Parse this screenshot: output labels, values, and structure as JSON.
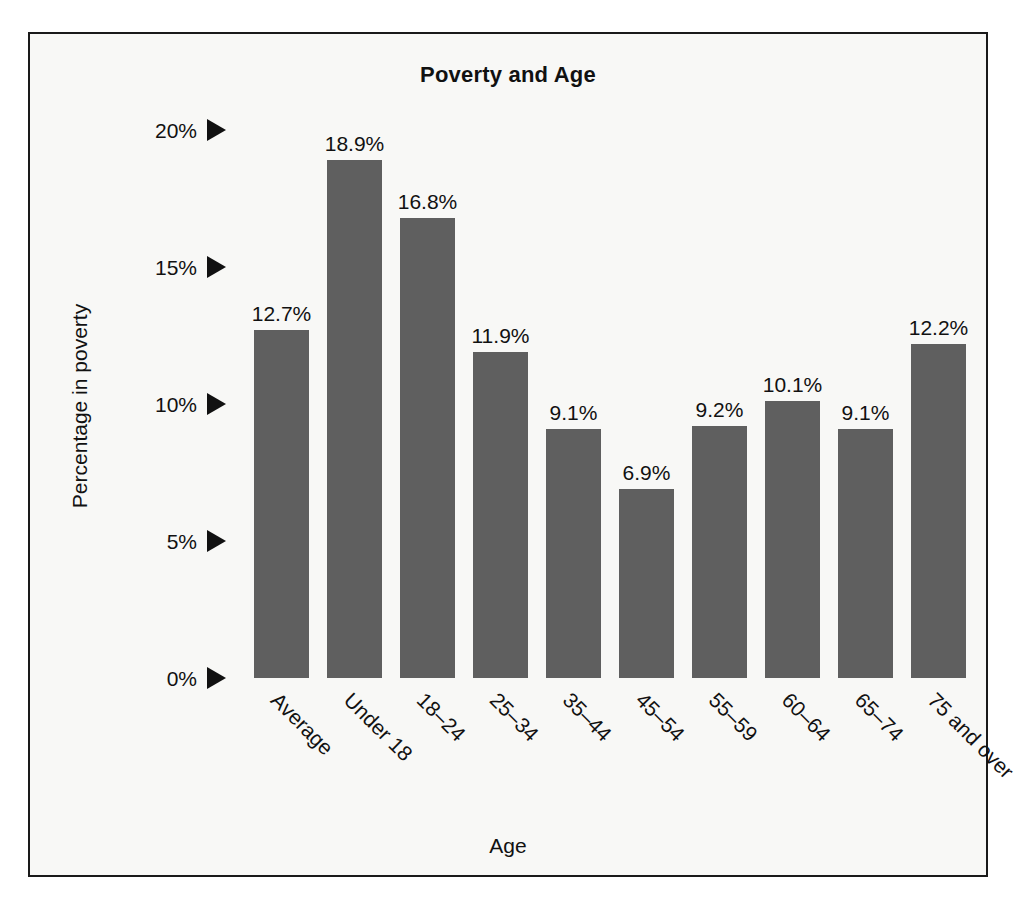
{
  "chart_data": {
    "type": "bar",
    "title": "Poverty and Age",
    "xlabel": "Age",
    "ylabel": "Percentage in poverty",
    "categories": [
      "Average",
      "Under 18",
      "18–24",
      "25–34",
      "35–44",
      "45–54",
      "55–59",
      "60–64",
      "65–74",
      "75 and over"
    ],
    "values": [
      12.7,
      18.9,
      16.8,
      11.9,
      9.1,
      6.9,
      9.2,
      10.1,
      9.1,
      12.2
    ],
    "value_labels": [
      "12.7%",
      "18.9%",
      "16.8%",
      "11.9%",
      "9.1%",
      "6.9%",
      "9.2%",
      "10.1%",
      "9.1%",
      "12.2%"
    ],
    "ylim": [
      0,
      20
    ],
    "ytick_values": [
      0,
      5,
      10,
      15,
      20
    ],
    "ytick_labels": [
      "0%",
      "5%",
      "10%",
      "15%",
      "20%"
    ],
    "ytick_marker": "right-triangle-marker",
    "grid": false,
    "legend": false,
    "bar_color": "#5f5f5f",
    "text_color": "#111111",
    "background_color": "#f8f8f6",
    "frame_color": "#1a1a1a",
    "xtick_rotation_degrees": 45
  }
}
